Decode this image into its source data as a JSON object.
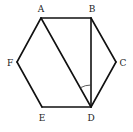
{
  "diagram": {
    "type": "geometry",
    "shape": "regular hexagon",
    "vertices": [
      {
        "name": "A",
        "x": 41,
        "y": 18,
        "label_x": 41,
        "label_y": 12
      },
      {
        "name": "B",
        "x": 91,
        "y": 18,
        "label_x": 92,
        "label_y": 12
      },
      {
        "name": "C",
        "x": 116,
        "y": 62,
        "label_x": 123,
        "label_y": 66
      },
      {
        "name": "D",
        "x": 91,
        "y": 107,
        "label_x": 91,
        "label_y": 121
      },
      {
        "name": "E",
        "x": 42,
        "y": 107,
        "label_x": 42,
        "label_y": 121
      },
      {
        "name": "F",
        "x": 17,
        "y": 62,
        "label_x": 10,
        "label_y": 66
      }
    ],
    "labels": {
      "A": "A",
      "B": "B",
      "C": "C",
      "D": "D",
      "E": "E",
      "F": "F"
    },
    "hexagon_edges": [
      "AB",
      "BC",
      "CD",
      "DE",
      "EF",
      "FA"
    ],
    "diagonals": [
      "AD",
      "BD"
    ],
    "marked_angle": {
      "vertex": "D",
      "between": [
        "DA",
        "DB"
      ],
      "name": "angle ADB"
    },
    "colors": {
      "stroke": "#111111",
      "label": "#222222",
      "background": "#ffffff"
    }
  }
}
